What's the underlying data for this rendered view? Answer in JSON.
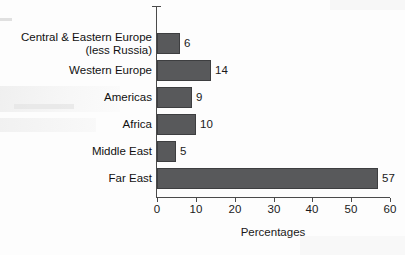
{
  "chart_data": {
    "type": "bar",
    "orientation": "horizontal",
    "title": "",
    "xlabel": "Percentages",
    "ylabel": "",
    "xlim": [
      0,
      60
    ],
    "xticks": [
      0,
      10,
      20,
      30,
      40,
      50,
      60
    ],
    "grid": false,
    "legend": null,
    "categories": [
      "Central & Eastern Europe\n(less Russia)",
      "Western Europe",
      "Americas",
      "Africa",
      "Middle East",
      "Far East"
    ],
    "values": [
      6,
      14,
      9,
      10,
      5,
      57
    ],
    "data_labels": [
      "6",
      "14",
      "9",
      "10",
      "5",
      "57"
    ],
    "bar_color": "#58595b",
    "bar_edge_color": "#3d3e40",
    "axis_color": "#4a4a4a",
    "background_color": "#fdfdfd"
  },
  "axis": {
    "tick_labels": [
      "0",
      "10",
      "20",
      "30",
      "40",
      "50",
      "60"
    ],
    "x_title": "Percentages"
  }
}
